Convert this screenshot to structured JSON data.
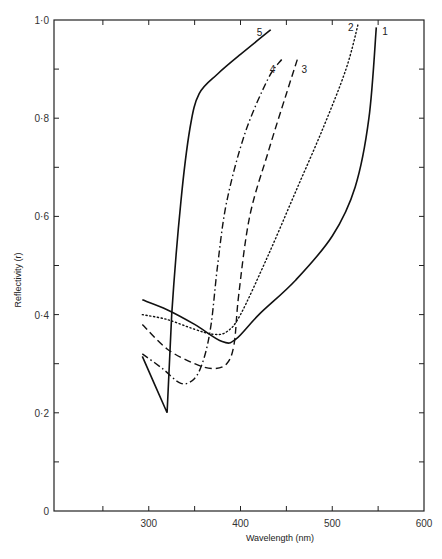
{
  "chart_data": {
    "type": "line",
    "title": "",
    "xlabel": "Wavelength (nm)",
    "ylabel": "Reflectivity (r)",
    "xlim": [
      200,
      600
    ],
    "ylim": [
      0,
      1.0
    ],
    "x_ticks": [
      300,
      400,
      500,
      600
    ],
    "x_tick_labels": [
      "300",
      "400",
      "500",
      "600"
    ],
    "y_ticks": [
      0,
      0.2,
      0.4,
      0.6,
      0.8,
      1.0
    ],
    "y_tick_labels": [
      "0",
      "0·2",
      "0·4",
      "0·6",
      "0·8",
      "1·0"
    ],
    "grid": false,
    "legend": "curve numbers labelled at line ends",
    "series": [
      {
        "name": "1",
        "style": "solid",
        "x": [
          293,
          320,
          350,
          380,
          395,
          420,
          460,
          500,
          525,
          540,
          548
        ],
        "y": [
          0.43,
          0.41,
          0.38,
          0.345,
          0.35,
          0.4,
          0.47,
          0.56,
          0.66,
          0.8,
          0.985
        ]
      },
      {
        "name": "2",
        "style": "dotted",
        "x": [
          293,
          320,
          350,
          370,
          385,
          400,
          430,
          460,
          490,
          515,
          528
        ],
        "y": [
          0.4,
          0.39,
          0.37,
          0.36,
          0.365,
          0.4,
          0.52,
          0.65,
          0.78,
          0.9,
          0.99
        ]
      },
      {
        "name": "3",
        "style": "dashed",
        "x": [
          293,
          320,
          350,
          370,
          385,
          393,
          398,
          410,
          430,
          450,
          462
        ],
        "y": [
          0.38,
          0.33,
          0.3,
          0.29,
          0.3,
          0.34,
          0.44,
          0.6,
          0.73,
          0.85,
          0.92
        ]
      },
      {
        "name": "4",
        "style": "dash-dot",
        "x": [
          293,
          315,
          335,
          350,
          360,
          368,
          375,
          385,
          405,
          430,
          445
        ],
        "y": [
          0.32,
          0.29,
          0.26,
          0.27,
          0.31,
          0.38,
          0.5,
          0.63,
          0.77,
          0.88,
          0.92
        ]
      },
      {
        "name": "5",
        "style": "solid",
        "x": [
          293,
          320,
          325,
          335,
          345,
          355,
          375,
          400,
          433
        ],
        "y": [
          0.315,
          0.2,
          0.4,
          0.63,
          0.78,
          0.85,
          0.89,
          0.93,
          0.98
        ]
      }
    ]
  },
  "labels": {
    "xlabel": "Wavelength (nm)",
    "ylabel": "Reflectivity (r)",
    "caption": "... of the ... of the ... cut ... of ..."
  }
}
